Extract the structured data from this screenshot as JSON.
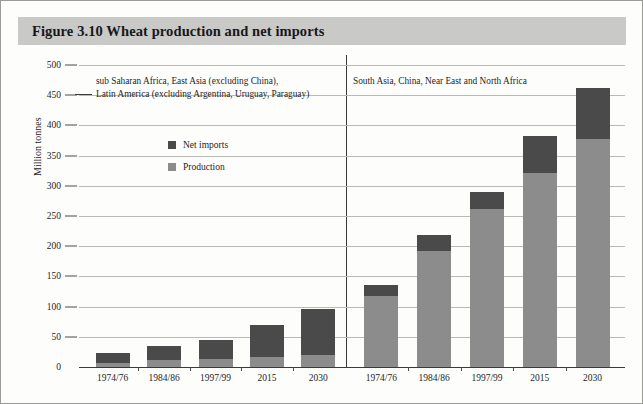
{
  "figure": {
    "title": "Figure 3.10  Wheat production and net imports",
    "banner_color": "#c9c9c7"
  },
  "legend": {
    "items": [
      {
        "label": "Net imports",
        "color": "#4a4a4a",
        "key": "net_imports"
      },
      {
        "label": "Production",
        "color": "#8c8c8c",
        "key": "production"
      }
    ]
  },
  "annotations": {
    "left_line1": "sub Saharan Africa, East Asia (excluding China),",
    "left_line2": "Latin America (excluding Argentina, Uruguay, Paraguay)",
    "right_line1": "South Asia, China, Near East and North Africa"
  },
  "axis": {
    "y_title": "Million tonnes",
    "y_ticks": [
      "500",
      "450",
      "400",
      "350",
      "300",
      "250",
      "200",
      "150",
      "100",
      "50",
      "0"
    ]
  },
  "chart_data": {
    "type": "bar",
    "title": "Figure 3.10  Wheat production and net imports",
    "subtitle": "",
    "xlabel": "",
    "ylabel": "Million tonnes",
    "ylim": [
      0,
      500
    ],
    "ytick_values": [
      0,
      50,
      100,
      150,
      200,
      250,
      300,
      350,
      400,
      450,
      500
    ],
    "grid": true,
    "stacked": true,
    "legend_position": "inside-upper-left",
    "panels": [
      {
        "name": "left",
        "group_label": "sub Saharan Africa, East Asia (excluding China), Latin America (excluding Argentina, Uruguay, Paraguay)",
        "categories": [
          "1974/76",
          "1984/86",
          "1997/99",
          "2015",
          "2030"
        ],
        "series": [
          {
            "name": "Production",
            "color": "#8c8c8c",
            "values": [
              7,
              11,
              13,
              16,
              20
            ]
          },
          {
            "name": "Net imports",
            "color": "#4a4a4a",
            "values": [
              16,
              23,
              32,
              53,
              76
            ]
          }
        ],
        "totals": [
          23,
          34,
          45,
          69,
          96
        ]
      },
      {
        "name": "right",
        "group_label": "South Asia, China, Near East and North Africa",
        "categories": [
          "1974/76",
          "1984/86",
          "1997/99",
          "2015",
          "2030"
        ],
        "series": [
          {
            "name": "Production",
            "color": "#8c8c8c",
            "values": [
              118,
              192,
              262,
              322,
              378
            ]
          },
          {
            "name": "Net imports",
            "color": "#4a4a4a",
            "values": [
              17,
              26,
              28,
              61,
              84
            ]
          }
        ],
        "totals": [
          135,
          218,
          290,
          383,
          462
        ]
      }
    ]
  }
}
